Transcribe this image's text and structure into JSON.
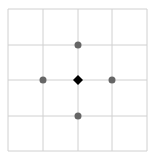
{
  "grid": {
    "cols": 4,
    "rows": 4,
    "x_lines": [
      8,
      43,
      78,
      112,
      147
    ],
    "y_lines": [
      9,
      45,
      80,
      116,
      151
    ],
    "line_color": "#d0d0d0"
  },
  "center_marker": {
    "shape": "diamond",
    "x": 78,
    "y": 80,
    "color": "#000000"
  },
  "neighbor_dots": [
    {
      "position": "up",
      "x": 78,
      "y": 45
    },
    {
      "position": "left",
      "x": 43,
      "y": 80
    },
    {
      "position": "right",
      "x": 112,
      "y": 80
    },
    {
      "position": "down",
      "x": 78,
      "y": 116
    }
  ],
  "dot_color": "#666666"
}
